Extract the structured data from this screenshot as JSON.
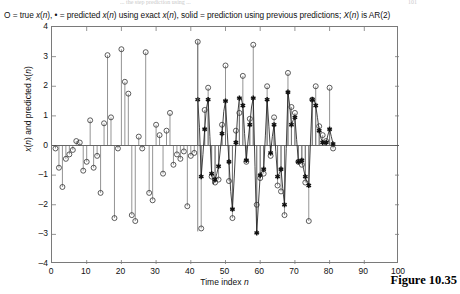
{
  "page": {
    "ghost_header": "...  the  step  prediction  using  ...",
    "ghost_pageno": "101",
    "figure_caption": "Figure 10.35"
  },
  "chart_data": {
    "type": "line",
    "title": "O = true x(n), • = predicted x(n) using exact x(n), solid = prediction using previous predictions; X(n) is AR(2)",
    "title_parts": [
      {
        "text": "O = true "
      },
      {
        "text": "x",
        "italic": true
      },
      {
        "text": "("
      },
      {
        "text": "n",
        "italic": true
      },
      {
        "text": "), • = predicted "
      },
      {
        "text": "x",
        "italic": true
      },
      {
        "text": "("
      },
      {
        "text": "n",
        "italic": true
      },
      {
        "text": ") using exact "
      },
      {
        "text": "x",
        "italic": true
      },
      {
        "text": "("
      },
      {
        "text": "n",
        "italic": true
      },
      {
        "text": "), solid = prediction using previous predictions; "
      },
      {
        "text": "X",
        "italic": true
      },
      {
        "text": "("
      },
      {
        "text": "n",
        "italic": true
      },
      {
        "text": ") is AR(2)"
      }
    ],
    "xlabel": "Time index n",
    "ylabel": "x(n) and predicted x(n)",
    "xlim": [
      0,
      100
    ],
    "ylim": [
      -4,
      4
    ],
    "xticks": [
      0,
      10,
      20,
      30,
      40,
      50,
      60,
      70,
      80,
      90,
      100
    ],
    "yticks": [
      4,
      3,
      2,
      1,
      0,
      -1,
      -2,
      -3,
      -4
    ],
    "grid": false,
    "legend_position": "title",
    "legend": [
      {
        "marker": "circle",
        "name": "true x(n)"
      },
      {
        "marker": "star",
        "name": "predicted x(n) using exact x(n)"
      },
      {
        "marker": "solid-line",
        "name": "prediction using previous predictions"
      }
    ],
    "axis_color": "#7a7a7a",
    "series": [
      {
        "name": "true x(n)",
        "marker": "circle",
        "stem": true,
        "x": [
          1,
          2,
          3,
          4,
          5,
          6,
          7,
          8,
          9,
          10,
          11,
          12,
          13,
          14,
          15,
          16,
          17,
          18,
          19,
          20,
          21,
          22,
          23,
          24,
          25,
          26,
          27,
          28,
          29,
          30,
          31,
          32,
          33,
          34,
          35,
          36,
          37,
          38,
          39,
          40,
          41,
          42,
          43,
          44,
          45,
          46,
          47,
          48,
          49,
          50,
          51,
          52,
          53,
          54,
          55,
          56,
          57,
          58,
          59,
          60,
          61,
          62,
          63,
          64,
          65,
          66,
          67,
          68,
          69,
          70,
          71,
          72,
          73,
          74,
          75,
          76,
          77,
          78,
          79,
          80,
          81
        ],
        "values": [
          -0.1,
          -0.75,
          -1.4,
          -0.45,
          -0.3,
          -0.15,
          0.15,
          0.1,
          -0.85,
          -0.55,
          0.85,
          -0.75,
          -0.35,
          -1.6,
          0.75,
          3.05,
          0.95,
          -2.45,
          -0.1,
          3.25,
          2.15,
          1.75,
          -2.35,
          -2.55,
          0.3,
          -0.1,
          3.15,
          -1.6,
          -1.85,
          0.7,
          0.35,
          -0.95,
          0.5,
          1.1,
          -0.65,
          -0.3,
          -0.45,
          -0.2,
          -2.05,
          -0.35,
          -0.25,
          3.5,
          -2.8,
          1.2,
          1.95,
          -1.05,
          -1.25,
          -1.15,
          0.7,
          2.7,
          -1.2,
          -2.45,
          0.5,
          1.1,
          2.35,
          -0.55,
          0.9,
          3.4,
          -2.0,
          -1.1,
          -0.95,
          2.0,
          -0.35,
          0.95,
          -1.35,
          -1.55,
          -2.35,
          2.45,
          1.3,
          1.1,
          -0.55,
          -0.65,
          -1.25,
          -2.55,
          1.55,
          2.0,
          0.65,
          0.35,
          0.15,
          1.95,
          -0.1
        ]
      },
      {
        "name": "predicted x(n) using exact x(n)",
        "marker": "star",
        "stem": true,
        "x": [
          42,
          43,
          44,
          45,
          46,
          47,
          48,
          49,
          50,
          51,
          52,
          53,
          54,
          55,
          56,
          57,
          58,
          59,
          60,
          61,
          62,
          63,
          64,
          65,
          66,
          67,
          68,
          69,
          70,
          71,
          72,
          73,
          74,
          75,
          76,
          77,
          78,
          79,
          80,
          81
        ],
        "values": [
          1.55,
          -1.05,
          0.55,
          1.55,
          -0.95,
          -1.15,
          -0.7,
          0.4,
          1.5,
          -0.55,
          -2.15,
          0.1,
          1.6,
          1.35,
          -0.5,
          0.7,
          1.6,
          -2.95,
          -1.0,
          -0.8,
          1.55,
          -0.25,
          0.7,
          -1.05,
          -0.8,
          -2.0,
          1.8,
          0.7,
          0.95,
          -0.55,
          -0.5,
          -1.05,
          -1.35,
          1.55,
          1.35,
          0.5,
          0.1,
          0.1,
          0.55,
          0.05
        ]
      },
      {
        "name": "prediction using previous predictions",
        "marker": "none",
        "line": "solid",
        "x": [
          42,
          42.5,
          43,
          43.5,
          44,
          44.5,
          45,
          45.5,
          46,
          46.5,
          47,
          47.5,
          48,
          48.5,
          49,
          49.5,
          50,
          50.5,
          51,
          51.5,
          52,
          52.5,
          53,
          53.5,
          54,
          54.5,
          55,
          55.5,
          56,
          56.5,
          57,
          57.5,
          58,
          58.5,
          59,
          59.5,
          60,
          60.5,
          61,
          61.5,
          62,
          62.5,
          63,
          63.5,
          64,
          64.5,
          65,
          65.5,
          66,
          66.5,
          67,
          67.5,
          68,
          68.5,
          69,
          69.5,
          70,
          70.5,
          71,
          71.5,
          72,
          72.5,
          73,
          73.5,
          74,
          74.5,
          75,
          75.5,
          76,
          76.5,
          77,
          77.5,
          78,
          78.5,
          79,
          79.5,
          80,
          80.5,
          81
        ],
        "values": [
          1.55,
          0.6,
          -1.05,
          -0.3,
          0.55,
          1.25,
          1.55,
          0.3,
          -0.95,
          -1.3,
          -1.15,
          -0.95,
          -0.7,
          -0.15,
          0.4,
          1.15,
          1.5,
          0.45,
          -0.55,
          -1.55,
          -2.15,
          -1.1,
          0.1,
          1.05,
          1.6,
          1.6,
          1.35,
          0.4,
          -0.5,
          0.15,
          0.7,
          1.3,
          1.6,
          -0.7,
          -2.95,
          -1.95,
          -1.0,
          -0.9,
          -0.8,
          0.35,
          1.55,
          0.65,
          -0.25,
          0.3,
          0.7,
          -0.2,
          -1.05,
          -0.95,
          -0.8,
          -1.45,
          -2.0,
          -0.1,
          1.8,
          1.35,
          0.7,
          0.85,
          0.95,
          0.2,
          -0.55,
          -0.55,
          -0.5,
          -0.8,
          -1.05,
          -1.25,
          -1.35,
          0.15,
          1.55,
          1.55,
          1.35,
          0.95,
          0.5,
          0.25,
          0.1,
          0.05,
          0.1,
          0.35,
          0.55,
          0.3,
          0.05
        ]
      }
    ],
    "divider_x": 42
  }
}
